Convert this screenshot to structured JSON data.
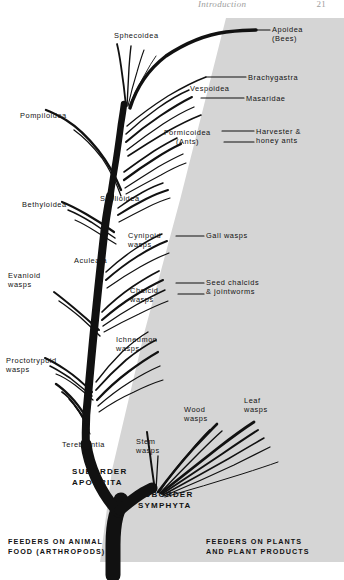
{
  "page": {
    "running_head_title": "Introduction",
    "page_number": "21",
    "width": 344,
    "height": 580
  },
  "colors": {
    "background": "#ffffff",
    "plant_zone_fill": "#d5d5d5",
    "branch_stroke": "#111111",
    "label_text": "#121212",
    "running_head": "#9d9d9d"
  },
  "figure": {
    "type": "phylogenetic-tree-diagram",
    "zones": [
      {
        "id": "animal-feeders",
        "caption_line1": "FEEDERS ON ANIMAL",
        "caption_line2": "FOOD (ARTHROPODS)",
        "shaded": false
      },
      {
        "id": "plant-feeders",
        "caption_line1": "FEEDERS ON PLANTS",
        "caption_line2": "AND PLANT PRODUCTS",
        "shaded": true
      }
    ],
    "suborders": [
      {
        "id": "apocrita",
        "line1": "SUBORDER",
        "line2": "APOCRITA"
      },
      {
        "id": "symphyta",
        "line1": "SUBORDER",
        "line2": "SYMPHYTA"
      }
    ],
    "labels": {
      "sphecoidea": "Sphecoidea",
      "apoidea_l1": "Apoidea",
      "apoidea_l2": "(Bees)",
      "brachygastra": "Brachygastra",
      "vespoidea": "Vespoidea",
      "masaridae": "Masaridae",
      "pompiloidea": "Pompiloidea",
      "formicoidea_l1": "Formicoidea",
      "formicoidea_l2": "(Ants)",
      "harvester_l1": "Harvester &",
      "harvester_l2": "honey ants",
      "bethyloidea": "Bethyloidea",
      "scolioidea": "Scolioidea",
      "cynipoid_l1": "Cynipoid",
      "cynipoid_l2": "wasps",
      "gall_wasps": "Gall wasps",
      "aculeata": "Aculeata",
      "evanioid_l1": "Evanioid",
      "evanioid_l2": "wasps",
      "chalcid_l1": "Chalcid",
      "chalcid_l2": "wasps",
      "seed_chalcids_l1": "Seed chalcids",
      "seed_chalcids_l2": "& jointworms",
      "ichneumon_l1": "Ichneumon",
      "ichneumon_l2": "wasps",
      "proctotrypoid_l1": "Proctotrypoid",
      "proctotrypoid_l2": "wasps",
      "terebrantia": "Terebrantia",
      "stem_l1": "Stem",
      "stem_l2": "wasps",
      "wood_l1": "Wood",
      "wood_l2": "wasps",
      "leaf_l1": "Leaf",
      "leaf_l2": "wasps"
    }
  }
}
